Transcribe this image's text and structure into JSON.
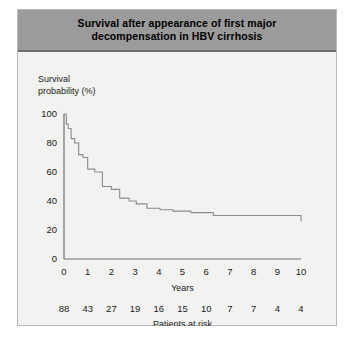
{
  "figure": {
    "title_line1": "Survival after appearance of first major",
    "title_line2": "decompensation in HBV cirrhosis",
    "header_color": "#9b9b9b",
    "panel_color": "#f2f2f0",
    "curve_color": "#8c8c8c",
    "axis_color": "#6f6f6f"
  },
  "chart_data": {
    "type": "line",
    "xlabel": "Years",
    "ylabel": "Survival probability (%)",
    "xlim": [
      0,
      10
    ],
    "ylim": [
      0,
      100
    ],
    "xticks": [
      0,
      1,
      2,
      3,
      4,
      5,
      6,
      7,
      8,
      9,
      10
    ],
    "xtick_labels": [
      "0",
      "1",
      "2",
      "3",
      "4",
      "5",
      "6",
      "7",
      "8",
      "9",
      "10"
    ],
    "yticks": [
      0,
      20,
      40,
      60,
      80,
      100
    ],
    "ytick_labels": [
      "0",
      "20",
      "40",
      "60",
      "80",
      "100"
    ],
    "grid": false,
    "legend": false,
    "step_style": "post",
    "series": [
      {
        "name": "Survival probability",
        "x": [
          0.0,
          0.1,
          0.18,
          0.3,
          0.45,
          0.62,
          0.8,
          1.0,
          1.3,
          1.62,
          2.0,
          2.35,
          2.75,
          3.05,
          3.5,
          4.05,
          4.6,
          5.35,
          6.3,
          10.0
        ],
        "y": [
          100,
          93,
          90,
          83,
          80,
          72,
          70,
          62,
          60,
          50,
          48,
          42,
          40,
          38,
          35,
          34,
          33,
          32,
          30,
          26
        ]
      }
    ],
    "risk_table": {
      "caption": "Patients at risk",
      "times": [
        0,
        1,
        2,
        3,
        4,
        5,
        6,
        7,
        8,
        9,
        10
      ],
      "counts": [
        "88",
        "43",
        "27",
        "19",
        "16",
        "15",
        "10",
        "7",
        "7",
        "4",
        "4"
      ]
    }
  }
}
